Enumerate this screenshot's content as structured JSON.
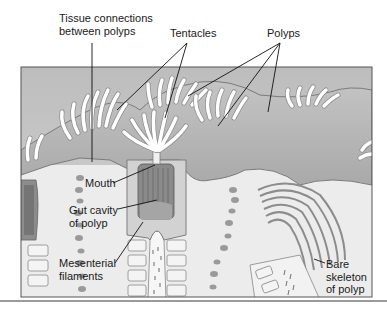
{
  "diagram": {
    "labels": {
      "tissue_connections": {
        "line1": "Tissue connections",
        "line2": "between polyps"
      },
      "tentacles": "Tentacles",
      "polyps": "Polyps",
      "mouth": "Mouth",
      "gut_cavity": {
        "line1": "Gut cavity",
        "line2": "of polyp"
      },
      "mesenterial": {
        "line1": "Mesenterial",
        "line2": "filaments"
      },
      "bare_skeleton": {
        "line1": "Bare",
        "line2": "skeleton",
        "line3": "of polyp"
      }
    },
    "colors": {
      "background": "#ffffff",
      "panel_fill": "#c8c8c8",
      "panel_border": "#555555",
      "tissue": "#b9b9b9",
      "tentacle": "#f2f2f2",
      "skeleton": "#e6e6e6",
      "leader_line": "#111111"
    }
  }
}
